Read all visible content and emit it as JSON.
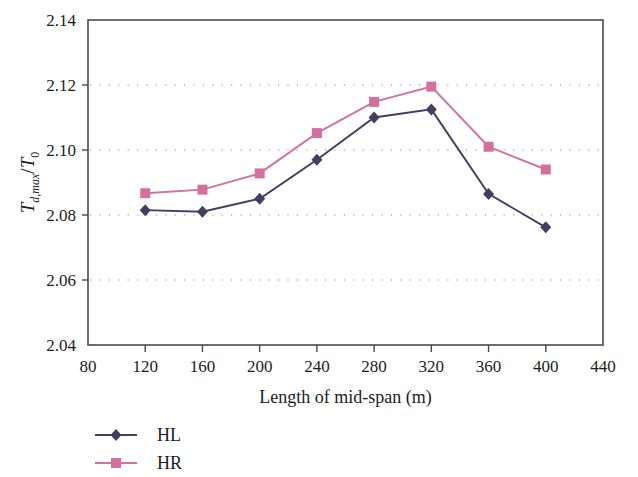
{
  "chart_data": {
    "type": "line",
    "title": "",
    "xlabel": "Length of mid-span (m)",
    "ylabel": "T_{d,max}/T_0",
    "ylabel_parts": {
      "main": "T",
      "sub1": "d,max",
      "slash": "/",
      "main2": "T",
      "sub2": "0"
    },
    "xlim": [
      80,
      440
    ],
    "ylim": [
      2.04,
      2.14
    ],
    "xticks": [
      80,
      120,
      160,
      200,
      240,
      280,
      320,
      360,
      400,
      440
    ],
    "yticks": [
      "2.04",
      "2.06",
      "2.08",
      "2.10",
      "2.12",
      "2.14"
    ],
    "ytick_values": [
      2.04,
      2.06,
      2.08,
      2.1,
      2.12,
      2.14
    ],
    "grid": "horizontal-dotted",
    "legend_position": "below-left",
    "x": [
      120,
      160,
      200,
      240,
      280,
      320,
      360,
      400
    ],
    "series": [
      {
        "name": "HL",
        "color": "#3f4060",
        "marker": "diamond",
        "values": [
          2.0815,
          2.081,
          2.085,
          2.097,
          2.11,
          2.1125,
          2.0865,
          2.0762
        ]
      },
      {
        "name": "HR",
        "color": "#d4709f",
        "marker": "square",
        "values": [
          2.0867,
          2.0878,
          2.0928,
          2.1052,
          2.1148,
          2.1195,
          2.101,
          2.094
        ]
      }
    ]
  },
  "legend": {
    "items": [
      {
        "label": "HL",
        "color": "#3f4060",
        "marker": "diamond"
      },
      {
        "label": "HR",
        "color": "#d4709f",
        "marker": "square"
      }
    ]
  }
}
